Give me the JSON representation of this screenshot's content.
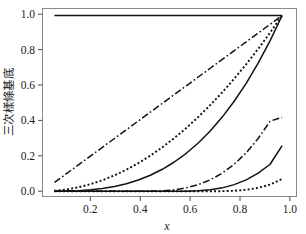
{
  "figure": {
    "background_color": "#ffffff",
    "frame_color": "#8a8a8a",
    "curve_color": "#111111"
  },
  "axes": {
    "x_title": "x",
    "y_title": "三次樣條基底",
    "x_ticks": [
      "0.2",
      "0.4",
      "0.6",
      "0.8",
      "1.0"
    ],
    "y_ticks": [
      "0.0",
      "0.2",
      "0.4",
      "0.6",
      "0.8",
      "1.0"
    ]
  },
  "chart_data": {
    "type": "line",
    "title": "",
    "xlabel": "x",
    "ylabel": "三次樣條基底",
    "xlim": [
      0.0,
      1.06
    ],
    "ylim": [
      -0.03,
      1.04
    ],
    "x_ticks": [
      0.2,
      0.4,
      0.6,
      0.8,
      1.0
    ],
    "y_ticks": [
      0.0,
      0.2,
      0.4,
      0.6,
      0.8,
      1.0
    ],
    "grid": false,
    "legend": "none",
    "x": [
      0.05,
      0.1,
      0.15,
      0.2,
      0.25,
      0.3,
      0.35,
      0.4,
      0.45,
      0.5,
      0.55,
      0.6,
      0.65,
      0.7,
      0.75,
      0.8,
      0.85,
      0.9,
      0.95,
      1.0
    ],
    "series": [
      {
        "name": "constant-basis",
        "style": "solid",
        "values": [
          1.0,
          1.0,
          1.0,
          1.0,
          1.0,
          1.0,
          1.0,
          1.0,
          1.0,
          1.0,
          1.0,
          1.0,
          1.0,
          1.0,
          1.0,
          1.0,
          1.0,
          1.0,
          1.0,
          1.0
        ]
      },
      {
        "name": "linear-basis",
        "style": "dashdot",
        "values": [
          0.05,
          0.1,
          0.15,
          0.2,
          0.25,
          0.3,
          0.35,
          0.4,
          0.45,
          0.5,
          0.55,
          0.6,
          0.65,
          0.7,
          0.75,
          0.8,
          0.85,
          0.9,
          0.95,
          1.0
        ]
      },
      {
        "name": "quadratic-basis",
        "style": "dotted",
        "values": [
          0.0025,
          0.01,
          0.0225,
          0.04,
          0.0625,
          0.09,
          0.1225,
          0.16,
          0.2025,
          0.25,
          0.3025,
          0.36,
          0.4225,
          0.49,
          0.5625,
          0.64,
          0.7225,
          0.81,
          0.9025,
          1.0
        ]
      },
      {
        "name": "cubic-basis",
        "style": "solid",
        "values": [
          0.000125,
          0.001,
          0.003375,
          0.008,
          0.015625,
          0.027,
          0.042875,
          0.064,
          0.091125,
          0.125,
          0.166375,
          0.216,
          0.274625,
          0.343,
          0.421875,
          0.512,
          0.614125,
          0.729,
          0.857375,
          1.0
        ]
      },
      {
        "name": "truncated-power-knot-1",
        "style": "dashdot",
        "values": [
          0.0,
          0.0,
          0.0,
          0.0,
          0.0,
          0.0,
          0.0,
          0.0,
          0.0003,
          0.0024,
          0.0081,
          0.0192,
          0.0375,
          0.0648,
          0.1029,
          0.1536,
          0.2187,
          0.3,
          0.3993,
          0.42
        ]
      },
      {
        "name": "truncated-power-knot-2",
        "style": "solid",
        "values": [
          0.0,
          0.0,
          0.0,
          0.0,
          0.0,
          0.0,
          0.0,
          0.0,
          0.0,
          0.0,
          0.0,
          0.0003,
          0.0024,
          0.0081,
          0.0192,
          0.0375,
          0.0648,
          0.1029,
          0.1536,
          0.26
        ]
      },
      {
        "name": "truncated-power-knot-3",
        "style": "dotted",
        "values": [
          0.0,
          0.0,
          0.0,
          0.0,
          0.0,
          0.0,
          0.0,
          0.0,
          0.0,
          0.0,
          0.0,
          0.0,
          0.0,
          0.0,
          0.0003,
          0.0024,
          0.0081,
          0.0192,
          0.0375,
          0.07
        ]
      }
    ]
  }
}
